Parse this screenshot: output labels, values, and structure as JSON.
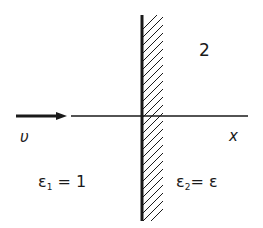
{
  "diagram": {
    "type": "physics-boundary",
    "region_label": "2",
    "velocity_label": "υ",
    "axis_label": "x",
    "medium1": {
      "symbol": "ε",
      "subscript": "1",
      "equals": " = ",
      "value": "1"
    },
    "medium2": {
      "symbol": "ε",
      "subscript": "2",
      "equals": "= ",
      "value": "ε"
    },
    "colors": {
      "ink": "#1a1a1a",
      "background": "#ffffff"
    }
  }
}
